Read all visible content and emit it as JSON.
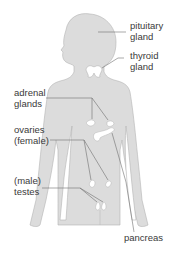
{
  "diagram": {
    "colors": {
      "body_fill": "#dcdcdc",
      "body_outline": "#b4b4b4",
      "organ_fill": "#ffffff",
      "leader_line": "#6e6e6e",
      "label_text": "#3a3a3a"
    },
    "labels": {
      "pituitary": {
        "line1": "pituitary",
        "line2": "gland"
      },
      "thyroid": {
        "line1": "thyroid",
        "line2": "gland"
      },
      "adrenal": {
        "line1": "adrenal",
        "line2": "glands"
      },
      "ovaries": {
        "line1": "ovaries",
        "line2": "(female)"
      },
      "testes": {
        "line1": "(male)",
        "line2": "testes"
      },
      "pancreas": {
        "line1": "pancreas"
      }
    }
  }
}
